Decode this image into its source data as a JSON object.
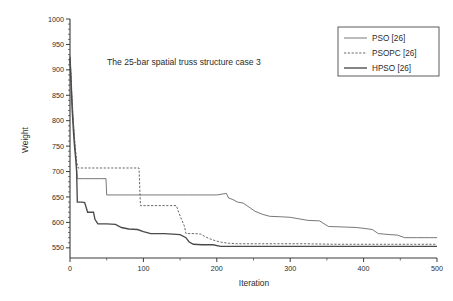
{
  "chart_data": {
    "type": "line",
    "title": "The 25-bar spatial truss structure case 3",
    "xlabel": "Iteration",
    "ylabel": "Weight",
    "xlim": [
      0,
      500
    ],
    "ylim": [
      530,
      1000
    ],
    "y_axis_display_min": 550,
    "grid": false,
    "legend_position": "top-right",
    "xticks": [
      0,
      100,
      200,
      300,
      400,
      500
    ],
    "xtick_labels": [
      "0",
      "100",
      "200",
      "300",
      "400",
      "500"
    ],
    "x_minor_tick_step": 50,
    "yticks": [
      550,
      600,
      650,
      700,
      750,
      800,
      850,
      900,
      950,
      1000
    ],
    "ytick_labels": [
      "550",
      "600",
      "650",
      "700",
      "750",
      "800",
      "850",
      "900",
      "950",
      "1000"
    ],
    "y_minor_tick_step": 10,
    "series": [
      {
        "name": "PSO [26]",
        "style": "solid-thin",
        "color": "#555555",
        "width": 0.8,
        "points": [
          [
            0,
            928
          ],
          [
            1,
            905
          ],
          [
            2,
            872
          ],
          [
            3,
            840
          ],
          [
            4,
            812
          ],
          [
            5,
            790
          ],
          [
            6,
            768
          ],
          [
            7,
            748
          ],
          [
            8,
            730
          ],
          [
            9,
            706
          ],
          [
            10,
            686
          ],
          [
            20,
            686
          ],
          [
            30,
            686
          ],
          [
            40,
            686
          ],
          [
            49,
            686
          ],
          [
            50,
            654
          ],
          [
            80,
            654
          ],
          [
            120,
            654
          ],
          [
            160,
            654
          ],
          [
            200,
            654
          ],
          [
            213,
            657
          ],
          [
            216,
            648
          ],
          [
            222,
            645
          ],
          [
            228,
            640
          ],
          [
            236,
            638
          ],
          [
            244,
            630
          ],
          [
            252,
            622
          ],
          [
            262,
            616
          ],
          [
            272,
            612
          ],
          [
            288,
            611
          ],
          [
            300,
            610
          ],
          [
            312,
            607
          ],
          [
            324,
            604
          ],
          [
            340,
            603
          ],
          [
            352,
            592
          ],
          [
            372,
            591
          ],
          [
            390,
            590
          ],
          [
            402,
            588
          ],
          [
            412,
            586
          ],
          [
            420,
            578
          ],
          [
            436,
            576
          ],
          [
            446,
            575
          ],
          [
            456,
            570
          ],
          [
            472,
            570
          ],
          [
            490,
            570
          ],
          [
            500,
            570
          ]
        ]
      },
      {
        "name": "PSOPC [26]",
        "style": "dashed",
        "color": "#555555",
        "width": 0.9,
        "points": [
          [
            0,
            925
          ],
          [
            1,
            896
          ],
          [
            2,
            862
          ],
          [
            3,
            833
          ],
          [
            4,
            806
          ],
          [
            5,
            786
          ],
          [
            6,
            766
          ],
          [
            7,
            748
          ],
          [
            8,
            736
          ],
          [
            9,
            720
          ],
          [
            11,
            707
          ],
          [
            30,
            707
          ],
          [
            60,
            707
          ],
          [
            80,
            707
          ],
          [
            94,
            707
          ],
          [
            96,
            633
          ],
          [
            120,
            633
          ],
          [
            140,
            633
          ],
          [
            145,
            633
          ],
          [
            148,
            620
          ],
          [
            152,
            606
          ],
          [
            156,
            592
          ],
          [
            158,
            578
          ],
          [
            170,
            578
          ],
          [
            178,
            577
          ],
          [
            184,
            572
          ],
          [
            190,
            568
          ],
          [
            198,
            564
          ],
          [
            206,
            561
          ],
          [
            216,
            559
          ],
          [
            228,
            558
          ],
          [
            250,
            558
          ],
          [
            280,
            558
          ],
          [
            320,
            558
          ],
          [
            360,
            557
          ],
          [
            400,
            557
          ],
          [
            440,
            557
          ],
          [
            470,
            557
          ],
          [
            500,
            557
          ]
        ]
      },
      {
        "name": "HPSO [26]",
        "style": "solid-medium",
        "color": "#4a4a4a",
        "width": 1.35,
        "points": [
          [
            0,
            922
          ],
          [
            1,
            888
          ],
          [
            2,
            852
          ],
          [
            3,
            820
          ],
          [
            4,
            795
          ],
          [
            5,
            772
          ],
          [
            6,
            752
          ],
          [
            7,
            736
          ],
          [
            8,
            722
          ],
          [
            9,
            700
          ],
          [
            10,
            640
          ],
          [
            16,
            640
          ],
          [
            20,
            639
          ],
          [
            24,
            620
          ],
          [
            32,
            620
          ],
          [
            34,
            606
          ],
          [
            38,
            597
          ],
          [
            50,
            597
          ],
          [
            62,
            596
          ],
          [
            70,
            590
          ],
          [
            80,
            587
          ],
          [
            92,
            586
          ],
          [
            100,
            582
          ],
          [
            110,
            578
          ],
          [
            128,
            578
          ],
          [
            140,
            577
          ],
          [
            150,
            576
          ],
          [
            158,
            570
          ],
          [
            162,
            562
          ],
          [
            168,
            557
          ],
          [
            180,
            556
          ],
          [
            195,
            556
          ],
          [
            205,
            553
          ],
          [
            240,
            553
          ],
          [
            300,
            553
          ],
          [
            360,
            553
          ],
          [
            420,
            553
          ],
          [
            470,
            553
          ],
          [
            500,
            553
          ]
        ]
      }
    ]
  },
  "legend": {
    "entries": [
      {
        "label": "PSO [26]"
      },
      {
        "label": "PSOPC [26]"
      },
      {
        "label": "HPSO [26]"
      }
    ]
  }
}
